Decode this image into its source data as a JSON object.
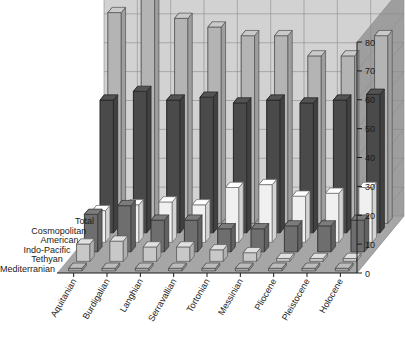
{
  "chart_data": {
    "type": "bar",
    "title": "",
    "subtitle": "",
    "xlabel": "",
    "ylabel": "",
    "zlabel": "",
    "render": "3d-grouped-bar",
    "grid": true,
    "legend_position": "none",
    "ylim": [
      0,
      80
    ],
    "ytick_step": 10,
    "yticks": [
      0,
      10,
      20,
      30,
      40,
      50,
      60,
      70,
      80
    ],
    "ytick_labels": [
      "0",
      "10",
      "20",
      "30",
      "40",
      "50",
      "60",
      "70",
      "80"
    ],
    "categories": [
      "Aquitanian",
      "Burdigalian",
      "Langhian",
      "Serravallian",
      "Tortonian",
      "Messinian",
      "Pliocene",
      "Pleistocene",
      "Holocene"
    ],
    "series": [
      {
        "name": "Total",
        "color": "#b4b4b4",
        "values": [
          73,
          82,
          71,
          68,
          65,
          65,
          58,
          58,
          65
        ]
      },
      {
        "name": "Cosmopolitan",
        "color": "#4a4a4a",
        "values": [
          46,
          49,
          46,
          47,
          45,
          46,
          45,
          46,
          48
        ]
      },
      {
        "name": "American",
        "color": "#f0f0f0",
        "values": [
          11,
          13,
          14,
          13,
          19,
          20,
          16,
          17,
          19
        ]
      },
      {
        "name": "Indo-Pacific",
        "color": "#6e6e6e",
        "values": [
          13,
          16,
          11,
          11,
          8,
          8,
          9,
          9,
          11
        ]
      },
      {
        "name": "Tethyan",
        "color": "#c8c8c8",
        "values": [
          6,
          7,
          5,
          5,
          4,
          3,
          1,
          1,
          1
        ]
      },
      {
        "name": "Mediterranian",
        "color": "#a8a8a8",
        "values": [
          0,
          0,
          0,
          0,
          0,
          0,
          0,
          0,
          0
        ]
      }
    ]
  },
  "axes": {
    "series_axis_labels": [
      "Total",
      "Cosmopolitan",
      "American",
      "Indo-Pacific",
      "Tethyan",
      "Mediterranian"
    ],
    "category_axis_labels": [
      "Aquitanian",
      "Burdigalian",
      "Langhian",
      "Serravallian",
      "Tortonian",
      "Messinian",
      "Pliocene",
      "Pleistocene",
      "Holocene"
    ],
    "value_axis_labels": [
      "80",
      "70",
      "60",
      "50",
      "40",
      "30",
      "20",
      "10",
      "0"
    ]
  },
  "colors": {
    "background": "#ffffff",
    "back_wall": "#d2d2d2",
    "side_wall": "#9e9e9e",
    "floor": "#a6a6a6",
    "gridline": "#8c8c8c",
    "text": "#1a1a1a"
  }
}
